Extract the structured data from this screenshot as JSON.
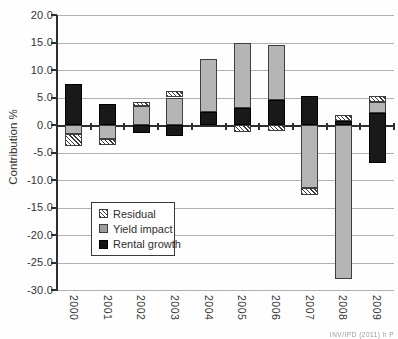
{
  "figure": {
    "y_axis": {
      "title": "Contribution %",
      "tick_labels": [
        "20.0",
        "15.0",
        "10.0",
        "5.0",
        "0.0",
        "-5.0",
        "-10.0",
        "-15.0",
        "-20.0",
        "-25.0",
        "-30.0"
      ],
      "tick_values": [
        20,
        15,
        10,
        5,
        0,
        -5,
        -10,
        -15,
        -20,
        -25,
        -30
      ]
    },
    "x_axis": {
      "categories": [
        "2000",
        "2001",
        "2002",
        "2003",
        "2004",
        "2005",
        "2006",
        "2007",
        "2008",
        "2009"
      ]
    },
    "legend": {
      "items": [
        {
          "id": "residual",
          "label": "Residual"
        },
        {
          "id": "yield",
          "label": "Yield impact"
        },
        {
          "id": "rental",
          "label": "Rental growth"
        }
      ]
    },
    "caption_fragment": "INV/IPD (2011) h P"
  },
  "chart_data": {
    "type": "bar",
    "stacked": true,
    "title": "",
    "xlabel": "",
    "ylabel": "Contribution %",
    "ylim": [
      -30,
      20
    ],
    "gridlines": true,
    "legend_position": "inside-lower-left",
    "categories": [
      "2000",
      "2001",
      "2002",
      "2003",
      "2004",
      "2005",
      "2006",
      "2007",
      "2008",
      "2009"
    ],
    "series": [
      {
        "name": "Residual",
        "id": "residual",
        "values": [
          -2.1,
          -1.2,
          0.7,
          1.2,
          0.0,
          -1.3,
          -1.0,
          -1.4,
          1.0,
          1.0
        ]
      },
      {
        "name": "Yield impact",
        "id": "yield",
        "values": [
          -1.7,
          -2.5,
          3.4,
          5.0,
          9.7,
          11.9,
          10.0,
          -11.4,
          -28.0,
          2.0
        ]
      },
      {
        "name": "Rental growth",
        "id": "rental",
        "values": [
          7.5,
          3.9,
          -1.4,
          -2.0,
          2.3,
          3.1,
          4.5,
          5.3,
          0.8,
          -9.2
        ]
      }
    ],
    "segments": [
      [
        {
          "series": "rental",
          "from": 0,
          "to": 7.5
        },
        {
          "series": "yield",
          "from": 0,
          "to": -1.7
        },
        {
          "series": "residual",
          "from": -1.7,
          "to": -3.8
        }
      ],
      [
        {
          "series": "rental",
          "from": 0,
          "to": 3.9
        },
        {
          "series": "yield",
          "from": 0,
          "to": -2.5
        },
        {
          "series": "residual",
          "from": -2.5,
          "to": -3.7
        }
      ],
      [
        {
          "series": "yield",
          "from": 0,
          "to": 3.4
        },
        {
          "series": "residual",
          "from": 3.4,
          "to": 4.1
        },
        {
          "series": "rental",
          "from": 0,
          "to": -1.4
        }
      ],
      [
        {
          "series": "yield",
          "from": 0,
          "to": 5.0
        },
        {
          "series": "residual",
          "from": 5.0,
          "to": 6.2
        },
        {
          "series": "rental",
          "from": 0,
          "to": -2.0
        }
      ],
      [
        {
          "series": "rental",
          "from": 0,
          "to": 2.3
        },
        {
          "series": "yield",
          "from": 2.3,
          "to": 12.0
        }
      ],
      [
        {
          "series": "rental",
          "from": 0,
          "to": 3.1
        },
        {
          "series": "yield",
          "from": 3.1,
          "to": 15.0
        },
        {
          "series": "residual",
          "from": 0,
          "to": -1.3
        }
      ],
      [
        {
          "series": "rental",
          "from": 0,
          "to": 4.5
        },
        {
          "series": "yield",
          "from": 4.5,
          "to": 14.5
        },
        {
          "series": "residual",
          "from": 0,
          "to": -1.0
        }
      ],
      [
        {
          "series": "rental",
          "from": 0,
          "to": 5.3
        },
        {
          "series": "yield",
          "from": 0,
          "to": -11.4
        },
        {
          "series": "residual",
          "from": -11.4,
          "to": -12.8
        }
      ],
      [
        {
          "series": "rental",
          "from": 0,
          "to": 0.8
        },
        {
          "series": "residual",
          "from": 0.8,
          "to": 1.8
        },
        {
          "series": "yield",
          "from": 0,
          "to": -28.0
        }
      ],
      [
        {
          "series": "yield",
          "from": 2.2,
          "to": 4.2
        },
        {
          "series": "residual",
          "from": 4.2,
          "to": 5.2
        },
        {
          "series": "rental",
          "from": 2.2,
          "to": -7.0
        }
      ]
    ]
  },
  "colors": {
    "rental_fill": "#191919",
    "yield_fill": "#b5b5b5",
    "residual_pattern": "diagonal-hatch",
    "gridline": "#b0b0b0",
    "axis": "#2e2e2e",
    "text": "#333333"
  }
}
